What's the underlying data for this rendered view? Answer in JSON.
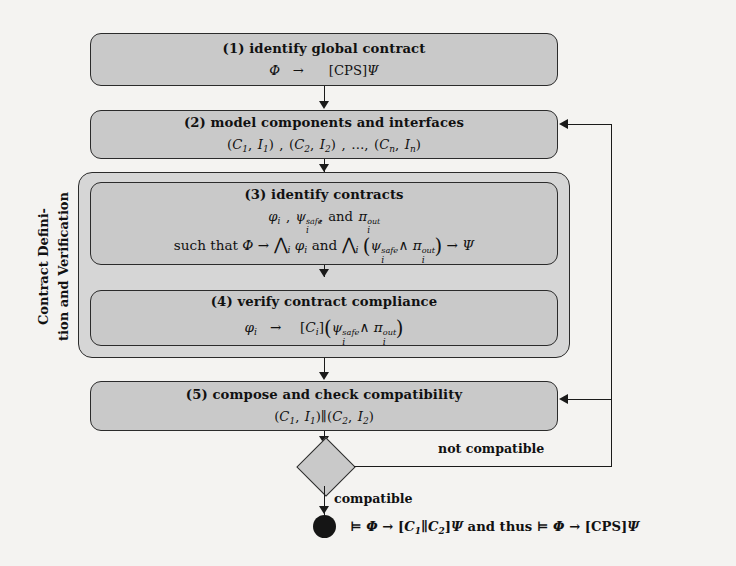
{
  "diagram": {
    "side_label_line1": "Contract Defini-",
    "side_label_line2": "tion and Verification",
    "colors": {
      "box_fill": "#c9c9c9",
      "group_fill": "#d6d6d6",
      "stroke": "#2b2b2b",
      "end_node": "#151515",
      "background": "#f4f3f1"
    },
    "steps": [
      {
        "id": "step1",
        "title": "(1) identify global contract",
        "formula_plain": "Φ  →  [CPS]Ψ"
      },
      {
        "id": "step2",
        "title": "(2) model components and interfaces",
        "formula_plain": "(C₁, I₁), (C₂, I₂), …, (Cₙ, Iₙ)"
      },
      {
        "id": "step3",
        "title": "(3) identify contracts",
        "formula_plain": "ϕᵢ, ψᵢ^safe, and πᵢ^out",
        "formula2_plain": "such that Φ → ⋀ᵢ ϕᵢ and ⋀ᵢ (ψᵢ^safe ∧ πᵢ^out) → Ψ"
      },
      {
        "id": "step4",
        "title": "(4) verify contract compliance",
        "formula_plain": "ϕᵢ  →  [Cᵢ](ψᵢ^safe ∧ πᵢ^out)"
      },
      {
        "id": "step5",
        "title": "(5) compose and check compatibility",
        "formula_plain": "(C₁, I₁)‖(C₂, I₂)"
      }
    ],
    "decision": {
      "id": "compatibility-decision",
      "shape": "diamond",
      "label": ""
    },
    "edges": {
      "not_compatible": "not compatible",
      "compatible": "compatible"
    },
    "result": {
      "formula_plain": "⊨ Φ → [C₁‖C₂]Ψ and thus ⊨ Φ → [CPS]Ψ"
    }
  }
}
